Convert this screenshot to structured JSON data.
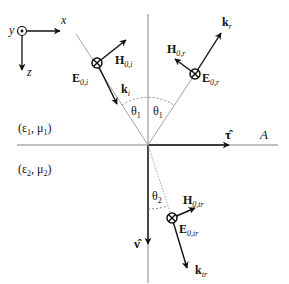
{
  "figure": {
    "colors": {
      "ink": "#111111",
      "guide_line": "#9a9a9a",
      "interface": "#808080",
      "background": "#ffffff"
    }
  },
  "axes": {
    "x_label": "x",
    "y_label": "y",
    "z_label": "z"
  },
  "media": {
    "upper": {
      "eps": "ε",
      "eps_sub": "1",
      "mu": "μ",
      "mu_sub": "1"
    },
    "lower": {
      "eps": "ε",
      "eps_sub": "2",
      "mu": "μ",
      "mu_sub": "2"
    }
  },
  "interface": {
    "label": "A",
    "tangent_label": "τ̂",
    "normal_label": "ν̂"
  },
  "incident": {
    "E_label": "E",
    "E_sub": "0,i",
    "H_label": "H",
    "H_sub": "0,i",
    "k_label": "k",
    "k_sub": "i",
    "angle_label": "θ",
    "angle_sub": "1"
  },
  "reflected": {
    "E_label": "E",
    "E_sub": "0,r",
    "H_label": "H",
    "H_sub": "0,r",
    "k_label": "k",
    "k_sub": "r",
    "angle_label": "θ",
    "angle_sub": "1"
  },
  "transmitted": {
    "E_label": "E",
    "E_sub": "0,tr",
    "H_label": "H",
    "H_sub": "0,tr",
    "k_label": "k",
    "k_sub": "tr",
    "angle_label": "θ",
    "angle_sub": "2"
  }
}
